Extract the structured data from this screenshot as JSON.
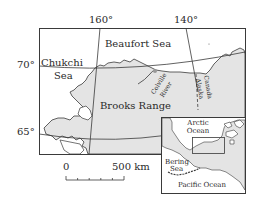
{
  "map": {
    "longitude_labels": [
      "160°",
      "140°"
    ],
    "latitude_labels": [
      "70°",
      "65°"
    ],
    "seas": {
      "beaufort": "Beaufort Sea",
      "chukchi_line1": "Chukchi",
      "chukchi_line2": "Sea"
    },
    "features": {
      "range": "Brooks Range",
      "river_line1": "Colville",
      "river_line2": "River",
      "border_canada": "Canada",
      "border_alaska": "Alaska"
    },
    "scale": {
      "start": "0",
      "end": "500 km"
    },
    "inset": {
      "arctic_line1": "Arctic",
      "arctic_line2": "Ocean",
      "bering_line1": "Bering",
      "bering_line2": "Sea",
      "pacific": "Pacific Ocean"
    },
    "colors": {
      "land": "#e4e4e4",
      "water": "#ffffff",
      "line": "#3a3a3a"
    }
  }
}
